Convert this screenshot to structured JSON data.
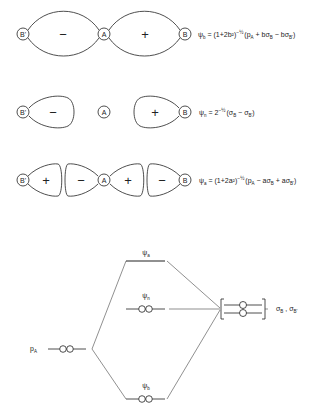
{
  "orbitals": {
    "bonding": {
      "atoms": [
        "B'",
        "A",
        "B"
      ],
      "lobe_signs": [
        "−",
        "+"
      ],
      "psi_symbol": "ψ",
      "psi_sub": "b",
      "equation_head": " = (1+2b²)",
      "equation_exp": "−½",
      "equation_tail": "(p",
      "term1_sub": "A",
      "term2": " + bσ",
      "term2_sub": "B",
      "term3": " − bσ",
      "term3_sub": "B'",
      "close": ")"
    },
    "nonbonding": {
      "atoms": [
        "B'",
        "A",
        "B"
      ],
      "lobe_signs": [
        "−",
        "+"
      ],
      "psi_symbol": "ψ",
      "psi_sub": "n",
      "equation_head": " = 2",
      "equation_exp": "−½",
      "equation_tail": "(σ",
      "term1_sub": "B",
      "term2": " − σ",
      "term2_sub": "B'",
      "close": ")"
    },
    "antibonding": {
      "atoms": [
        "B'",
        "A",
        "B"
      ],
      "lobe_signs": [
        "+",
        "−",
        "+",
        "−"
      ],
      "psi_symbol": "ψ",
      "psi_sub": "a",
      "equation_head": " = (1+2a²)",
      "equation_exp": "−½",
      "equation_tail": "(p",
      "term1_sub": "A",
      "term2": " − aσ",
      "term2_sub": "B",
      "term3": " + aσ",
      "term3_sub": "B'",
      "close": ")"
    }
  },
  "energy_diagram": {
    "levels": [
      {
        "id": "psi_a",
        "symbol": "ψ",
        "sub": "a",
        "sup": "b",
        "electrons": 0
      },
      {
        "id": "psi_n",
        "symbol": "ψ",
        "sub": "n",
        "sup": "b",
        "electrons": 2
      },
      {
        "id": "psi_b",
        "symbol": "ψ",
        "sub": "b",
        "sup": "b",
        "electrons": 2
      }
    ],
    "left_orbital": {
      "symbol": "p",
      "sub": "A",
      "electrons": 2
    },
    "right_orbitals": {
      "label_1": "σ",
      "label_1_sub": "B",
      "separator": " , ",
      "label_2": "σ",
      "label_2_sub": "B'",
      "electrons": 2
    }
  }
}
